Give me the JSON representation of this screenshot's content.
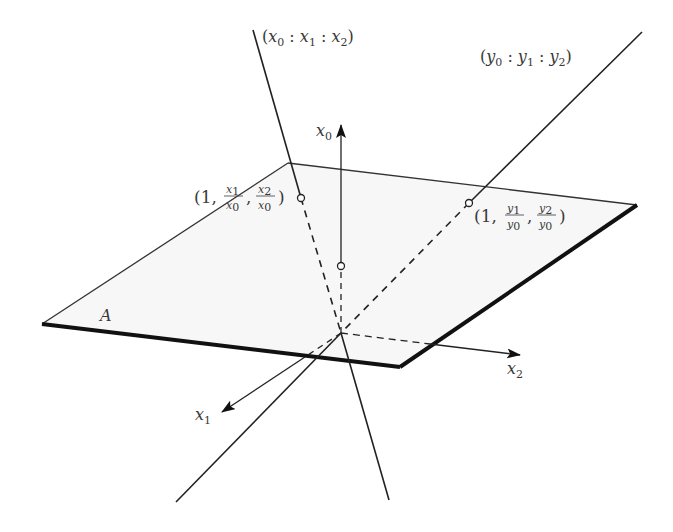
{
  "figure": {
    "type": "projective-plane-affine-chart",
    "colors": {
      "background": "#ffffff",
      "plane_fill": "#f7f7f7",
      "line": "#1a1a1a",
      "text": "#3a3a3a"
    },
    "plane": {
      "label": "A",
      "corners": {
        "back": [
          288,
          163
        ],
        "right": [
          637,
          205
        ],
        "front": [
          400,
          367
        ],
        "left": [
          42,
          324
        ]
      }
    },
    "origin": [
      341,
      333
    ],
    "axes": [
      {
        "name": "x0",
        "base": "x",
        "sub": "0",
        "from": [
          341,
          266
        ],
        "to": [
          341,
          125
        ],
        "label_pos": [
          328,
          122
        ]
      },
      {
        "name": "x1",
        "base": "x",
        "sub": "1",
        "from": [
          341,
          333
        ],
        "to": [
          222,
          412
        ],
        "label_pos": [
          192,
          420
        ]
      },
      {
        "name": "x2",
        "base": "x",
        "sub": "2",
        "from": [
          341,
          333
        ],
        "to": [
          520,
          355
        ],
        "label_pos": [
          506,
          376
        ]
      }
    ],
    "lines": [
      {
        "name": "line-x",
        "label": {
          "open": "(",
          "terms": [
            [
              "x",
              "0"
            ],
            [
              "x",
              "1"
            ],
            [
              "x",
              "2"
            ]
          ],
          "sep": ":",
          "close": ")"
        },
        "top": [
          253,
          30
        ],
        "bottom": [
          389,
          500
        ],
        "intersection": [
          301,
          198
        ],
        "intersection_label": {
          "lead": "(1, ",
          "frac1": [
            "x1",
            "x0"
          ],
          "frac2": [
            "x2",
            "x0"
          ],
          "close": ")"
        }
      },
      {
        "name": "line-y",
        "label": {
          "open": "(",
          "terms": [
            [
              "y",
              "0"
            ],
            [
              "y",
              "1"
            ],
            [
              "y",
              "2"
            ]
          ],
          "sep": ":",
          "close": ")"
        },
        "top": [
          642,
          32
        ],
        "bottom": [
          176,
          502
        ],
        "intersection": [
          469,
          203
        ],
        "intersection_label": {
          "lead": "(1, ",
          "frac1": [
            "y1",
            "y0"
          ],
          "frac2": [
            "y2",
            "y0"
          ],
          "close": ")"
        }
      }
    ],
    "text": {
      "line_x_label": "(x0 : x1 : x2)",
      "line_y_label": "(y0 : y1 : y2)",
      "point_x_label": "(1, x1/x0, x2/x0)",
      "point_y_label": "(1, y1/y0, y2/y0)",
      "axis_x0": "x0",
      "axis_x1": "x1",
      "axis_x2": "x2",
      "plane_label": "A"
    }
  }
}
